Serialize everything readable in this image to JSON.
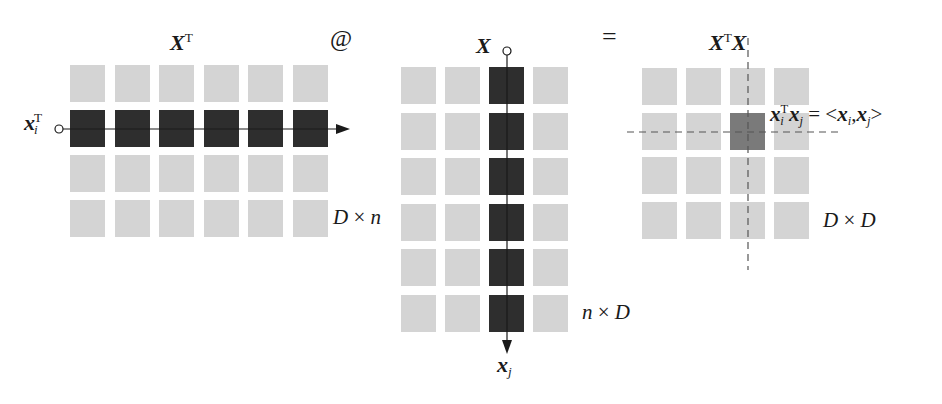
{
  "operators": {
    "matmul": "@",
    "equals": "="
  },
  "left_matrix": {
    "title": "X",
    "title_sup": "T",
    "rows": 4,
    "cols": 6,
    "highlight_row": 1,
    "dims_a": "D",
    "dims_x": "×",
    "dims_b": "n",
    "row_vector_label": "x",
    "row_vector_sub": "i",
    "row_vector_sup": "T"
  },
  "middle_matrix": {
    "title": "X",
    "rows": 6,
    "cols": 4,
    "highlight_col": 2,
    "dims_a": "n",
    "dims_x": "×",
    "dims_b": "D",
    "col_vector_label": "x",
    "col_vector_sub": "j"
  },
  "right_matrix": {
    "title_a": "X",
    "title_sup": "T",
    "title_b": "X",
    "rows": 4,
    "cols": 4,
    "highlight_row": 1,
    "highlight_col": 2,
    "dims_a": "D",
    "dims_x": "×",
    "dims_b": "D",
    "equation": {
      "lhs_a": "x",
      "lhs_a_sub": "i",
      "lhs_a_sup": "T",
      "lhs_b": "x",
      "lhs_b_sub": "j",
      "eq": " = <",
      "rhs_a": "x",
      "rhs_a_sub": "i",
      "comma": ",",
      "rhs_b": "x",
      "rhs_b_sub": "j",
      "close": ">"
    }
  },
  "colors": {
    "cell_light": "#d4d4d4",
    "cell_dark": "#2e2e2e",
    "cell_result": "#7a7a7a",
    "line": "#1a1a1a",
    "dash": "#555555"
  }
}
